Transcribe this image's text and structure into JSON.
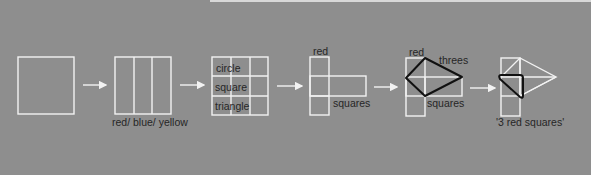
{
  "diagram": {
    "background_color": "#8e8e8e",
    "line_color": "#f2f2f2",
    "highlight_color": "#111111",
    "stages": [
      {
        "id": "stage-1",
        "shape": "square",
        "labels": []
      },
      {
        "id": "stage-2",
        "shape": "square-three-columns",
        "labels": [
          "red/ blue/ yellow"
        ]
      },
      {
        "id": "stage-3",
        "shape": "3x3-grid",
        "labels": [
          "circle",
          "square",
          "triangle"
        ]
      },
      {
        "id": "stage-4",
        "shape": "t-shape",
        "labels": [
          "red",
          "squares"
        ]
      },
      {
        "id": "stage-5",
        "shape": "t-shape-with-kite",
        "labels": [
          "red",
          "threes",
          "squares"
        ]
      },
      {
        "id": "stage-6",
        "shape": "kite-with-triangle",
        "labels": [
          "'3 red squares'"
        ]
      }
    ],
    "arrows": [
      "arrow-1",
      "arrow-2",
      "arrow-3",
      "arrow-4",
      "arrow-5"
    ],
    "labels": {
      "colors": "red/ blue/ yellow",
      "circle": "circle",
      "square": "square",
      "triangle": "triangle",
      "red_4": "red",
      "squares_4": "squares",
      "red_5": "red",
      "threes_5": "threes",
      "squares_5": "squares",
      "result_6": "'3 red squares'"
    }
  }
}
